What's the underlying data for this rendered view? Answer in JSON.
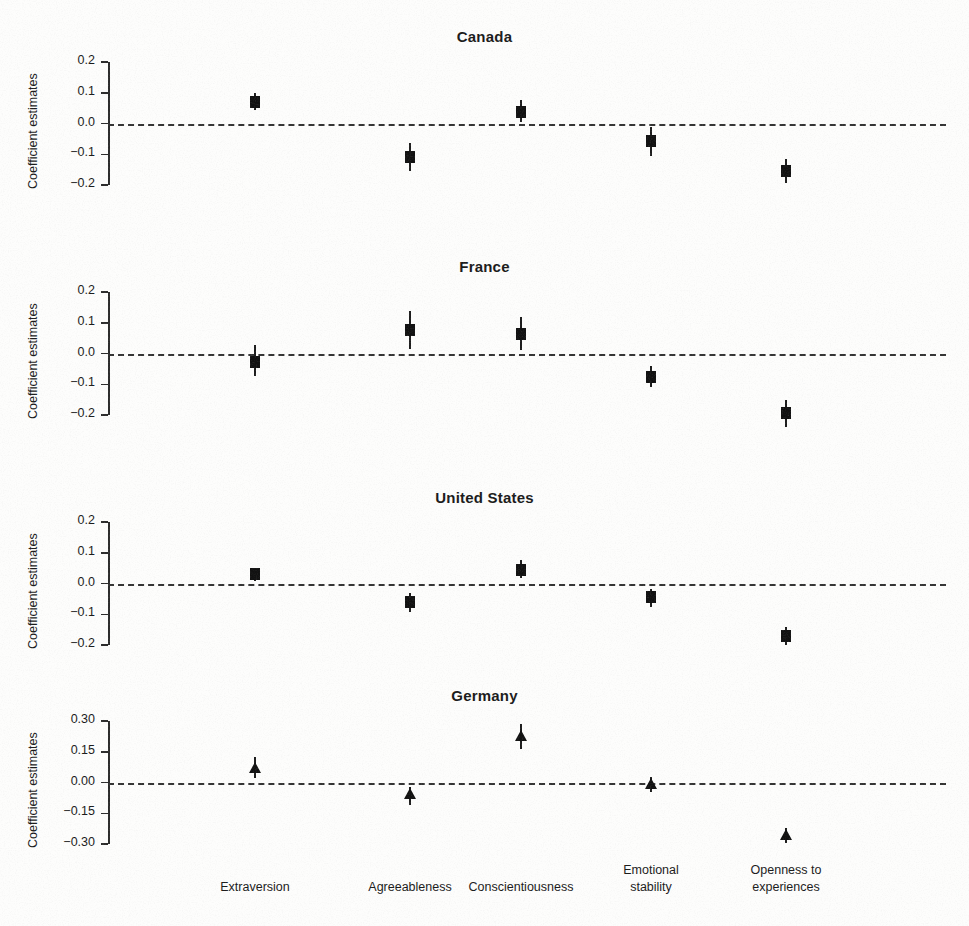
{
  "figure": {
    "ylabel": "Coefficient estimates",
    "categories": [
      "Extraversion",
      "Agreeableness",
      "Conscientiousness",
      "Emotional stability",
      "Openness to experiences"
    ],
    "category_lines": [
      [
        "Extraversion"
      ],
      [
        "Agreeableness"
      ],
      [
        "Conscientiousness"
      ],
      [
        "Emotional",
        "stability"
      ],
      [
        "Openness to",
        "experiences"
      ]
    ],
    "zero_reference": 0.0,
    "marker_color": "#111111",
    "axis_color": "#2b2b2b"
  },
  "chart_data": [
    {
      "type": "scatter",
      "title": "Canada",
      "xlabel": "",
      "ylabel": "Coefficient estimates",
      "ylim": [
        -0.2,
        0.2
      ],
      "yticks": [
        0.2,
        0.1,
        0.0,
        -0.1,
        -0.2
      ],
      "ytick_labels": [
        "0.2",
        "0.1",
        "0.0",
        "−0.1",
        "−0.2"
      ],
      "marker": "square",
      "grid": false,
      "legend": "none",
      "categories": [
        "Extraversion",
        "Agreeableness",
        "Conscientiousness",
        "Emotional stability",
        "Openness to experiences"
      ],
      "values": [
        0.07,
        -0.11,
        0.038,
        -0.057,
        -0.155
      ],
      "ci_low": [
        0.045,
        -0.155,
        0.005,
        -0.105,
        -0.195
      ],
      "ci_high": [
        0.1,
        -0.065,
        0.077,
        -0.012,
        -0.115
      ]
    },
    {
      "type": "scatter",
      "title": "France",
      "xlabel": "",
      "ylabel": "Coefficient estimates",
      "ylim": [
        -0.2,
        0.2
      ],
      "yticks": [
        0.2,
        0.1,
        0.0,
        -0.1,
        -0.2
      ],
      "ytick_labels": [
        "0.2",
        "0.1",
        "0.0",
        "−0.1",
        "−0.2"
      ],
      "marker": "square",
      "grid": false,
      "legend": "none",
      "categories": [
        "Extraversion",
        "Agreeableness",
        "Conscientiousness",
        "Emotional stability",
        "Openness to experiences"
      ],
      "values": [
        -0.028,
        0.077,
        0.064,
        -0.075,
        -0.195
      ],
      "ci_low": [
        -0.072,
        0.016,
        0.012,
        -0.11,
        -0.238
      ],
      "ci_high": [
        0.028,
        0.138,
        0.118,
        -0.04,
        -0.152
      ]
    },
    {
      "type": "scatter",
      "title": "United States",
      "xlabel": "",
      "ylabel": "Coefficient estimates",
      "ylim": [
        -0.2,
        0.2
      ],
      "yticks": [
        0.2,
        0.1,
        0.0,
        -0.1,
        -0.2
      ],
      "ytick_labels": [
        "0.2",
        "0.1",
        "0.0",
        "−0.1",
        "−0.2"
      ],
      "marker": "square",
      "grid": false,
      "legend": "none",
      "categories": [
        "Extraversion",
        "Agreeableness",
        "Conscientiousness",
        "Emotional stability",
        "Openness to experiences"
      ],
      "values": [
        0.03,
        -0.06,
        0.045,
        -0.045,
        -0.172
      ],
      "ci_low": [
        0.008,
        -0.092,
        0.018,
        -0.075,
        -0.2
      ],
      "ci_high": [
        0.052,
        -0.03,
        0.078,
        -0.018,
        -0.142
      ]
    },
    {
      "type": "scatter",
      "title": "Germany",
      "xlabel": "",
      "ylabel": "Coefficient estimates",
      "ylim": [
        -0.3,
        0.3
      ],
      "yticks": [
        0.3,
        0.15,
        0.0,
        -0.15,
        -0.3
      ],
      "ytick_labels": [
        "0.30",
        "0.15",
        "0.00",
        "−0.15",
        "−0.30"
      ],
      "marker": "triangle",
      "grid": false,
      "legend": "none",
      "categories": [
        "Extraversion",
        "Agreeableness",
        "Conscientiousness",
        "Emotional stability",
        "Openness to experiences"
      ],
      "values": [
        0.068,
        -0.062,
        0.22,
        -0.012,
        -0.262
      ],
      "ci_low": [
        0.02,
        -0.112,
        0.165,
        -0.048,
        -0.295
      ],
      "ci_high": [
        0.122,
        -0.022,
        0.285,
        0.028,
        -0.222
      ]
    }
  ]
}
